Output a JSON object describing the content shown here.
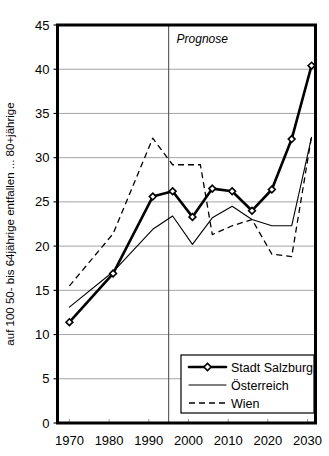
{
  "chart_data": {
    "type": "line",
    "title": "",
    "xlabel": "",
    "ylabel": "auf 100 50- bis 64jährige entfallen ... 80+jährige",
    "xlim": [
      1967,
      2032
    ],
    "ylim": [
      0,
      45
    ],
    "ytick_values": [
      0,
      5,
      10,
      15,
      20,
      25,
      30,
      35,
      40,
      45
    ],
    "ytick_labels": [
      "0",
      "5",
      "10",
      "15",
      "20",
      "25",
      "30",
      "35",
      "40",
      "45"
    ],
    "xtick_values": [
      1970,
      1980,
      1990,
      2000,
      2010,
      2020,
      2030
    ],
    "xtick_labels": [
      "1970",
      "1980",
      "1990",
      "2000",
      "2010",
      "2020",
      "2030"
    ],
    "grid": "horizontal",
    "legend_position": "bottom-right",
    "annotations": [
      {
        "text": "Prognose",
        "x": 1997,
        "y": 43.0,
        "style": "italic"
      }
    ],
    "divider": {
      "x": 1995,
      "label": "Prognose"
    },
    "series": [
      {
        "name": "Stadt Salzburg",
        "style": "solid-bold-diamond",
        "markers": true,
        "points": [
          {
            "x": 1970,
            "y": 11.4
          },
          {
            "x": 1981,
            "y": 16.9
          },
          {
            "x": 1991,
            "y": 25.6
          },
          {
            "x": 1996,
            "y": 26.2
          },
          {
            "x": 2001,
            "y": 23.3
          },
          {
            "x": 2006,
            "y": 26.5
          },
          {
            "x": 2011,
            "y": 26.2
          },
          {
            "x": 2016,
            "y": 24.0
          },
          {
            "x": 2021,
            "y": 26.4
          },
          {
            "x": 2026,
            "y": 32.1
          },
          {
            "x": 2031,
            "y": 40.4
          }
        ]
      },
      {
        "name": "Österreich",
        "style": "solid-thin",
        "markers": false,
        "points": [
          {
            "x": 1970,
            "y": 13.1
          },
          {
            "x": 1981,
            "y": 17.1
          },
          {
            "x": 1991,
            "y": 21.9
          },
          {
            "x": 1996,
            "y": 23.4
          },
          {
            "x": 2001,
            "y": 20.2
          },
          {
            "x": 2006,
            "y": 23.2
          },
          {
            "x": 2011,
            "y": 24.5
          },
          {
            "x": 2016,
            "y": 23.0
          },
          {
            "x": 2021,
            "y": 22.3
          },
          {
            "x": 2026,
            "y": 22.3
          },
          {
            "x": 2031,
            "y": 32.3
          }
        ]
      },
      {
        "name": "Wien",
        "style": "dashed",
        "markers": false,
        "points": [
          {
            "x": 1970,
            "y": 15.5
          },
          {
            "x": 1981,
            "y": 21.4
          },
          {
            "x": 1991,
            "y": 32.2
          },
          {
            "x": 1996,
            "y": 29.2
          },
          {
            "x": 2003,
            "y": 29.2
          },
          {
            "x": 2006,
            "y": 21.3
          },
          {
            "x": 2011,
            "y": 22.3
          },
          {
            "x": 2016,
            "y": 23.0
          },
          {
            "x": 2021,
            "y": 19.1
          },
          {
            "x": 2026,
            "y": 18.8
          },
          {
            "x": 2031,
            "y": 32.4
          }
        ]
      }
    ]
  },
  "legend": {
    "items": [
      {
        "label": "Stadt Salzburg",
        "style": "solid-bold-diamond"
      },
      {
        "label": "Österreich",
        "style": "solid-thin"
      },
      {
        "label": "Wien",
        "style": "dashed"
      }
    ]
  },
  "colors": {
    "line": "#000000",
    "grid": "#9a9a9a",
    "frame": "#000000",
    "background": "#ffffff"
  }
}
